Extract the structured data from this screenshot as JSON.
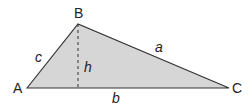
{
  "diagram": {
    "type": "triangle-with-height",
    "fill_color": "#d6d6d6",
    "stroke_color": "#333333",
    "vertices": {
      "A": {
        "label": "A",
        "x": 27,
        "y": 88
      },
      "B": {
        "label": "B",
        "x": 78,
        "y": 24
      },
      "C": {
        "label": "C",
        "x": 229,
        "y": 88
      }
    },
    "sides": {
      "a": {
        "label": "a",
        "from": "B",
        "to": "C"
      },
      "b": {
        "label": "b",
        "from": "A",
        "to": "C"
      },
      "c": {
        "label": "c",
        "from": "A",
        "to": "B"
      }
    },
    "height": {
      "label": "h",
      "from": "B",
      "foot_x": 78,
      "foot_y": 88,
      "style": "dashed"
    }
  }
}
